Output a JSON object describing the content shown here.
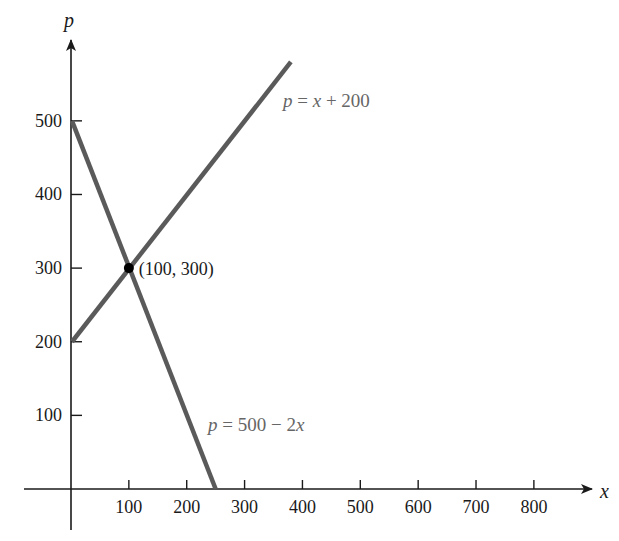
{
  "chart_data": {
    "type": "line",
    "title": "",
    "xlabel": "x",
    "ylabel": "p",
    "xlim": [
      -80,
      900
    ],
    "ylim": [
      -80,
      600
    ],
    "grid": false,
    "x_ticks": [
      100,
      200,
      300,
      400,
      500,
      600,
      700,
      800
    ],
    "x_tick_labels": [
      "100",
      "200",
      "300",
      "400",
      "500",
      "600",
      "700",
      "800"
    ],
    "y_ticks": [
      100,
      200,
      300,
      400,
      500
    ],
    "y_tick_labels": [
      "100",
      "200",
      "300",
      "400",
      "500"
    ],
    "series": [
      {
        "name": "p = x + 200",
        "x": [
          0,
          380
        ],
        "y": [
          200,
          580
        ],
        "color": "#5a5a5a"
      },
      {
        "name": "p = 500 − 2x",
        "x": [
          0,
          250
        ],
        "y": [
          500,
          0
        ],
        "color": "#5a5a5a"
      }
    ],
    "annotations": [
      {
        "type": "point",
        "x": 100,
        "y": 300,
        "label": "(100, 300)"
      },
      {
        "type": "text",
        "text": "p = x + 200",
        "near_series": 0
      },
      {
        "type": "text",
        "text": "p = 500 − 2x",
        "near_series": 1
      }
    ]
  },
  "labels": {
    "x_axis": "x",
    "y_axis": "p",
    "intersection": "(100, 300)",
    "eq1": {
      "var": "p",
      "rest": " = ",
      "x": "x",
      "tail": " + 200"
    },
    "eq2": {
      "var": "p",
      "rest": " = 500 − 2",
      "x": "x"
    }
  },
  "colors": {
    "axis": "#1a1a1a",
    "line": "#5a5a5a",
    "point": "#000000",
    "eq_text": "#666666"
  }
}
